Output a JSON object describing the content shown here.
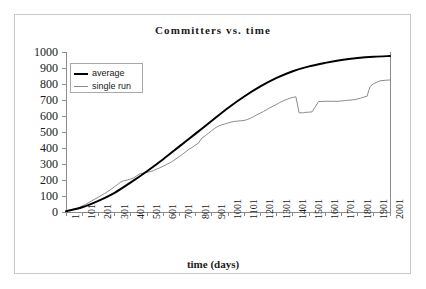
{
  "chart_data": {
    "type": "line",
    "title": "Committers vs. time",
    "xlabel": "time (days)",
    "ylabel": "",
    "xlim": [
      1,
      2001
    ],
    "ylim": [
      0,
      1000
    ],
    "grid": false,
    "legend_position": "top-left",
    "x_tick_labels": [
      "1",
      "101",
      "201",
      "301",
      "401",
      "501",
      "601",
      "701",
      "801",
      "901",
      "1001",
      "1101",
      "1201",
      "1301",
      "1401",
      "1501",
      "1601",
      "1701",
      "1801",
      "1901",
      "2001"
    ],
    "y_tick_labels": [
      "0",
      "100",
      "200",
      "300",
      "400",
      "500",
      "600",
      "700",
      "800",
      "900",
      "1000"
    ],
    "y_ticks": [
      0,
      100,
      200,
      300,
      400,
      500,
      600,
      700,
      800,
      900,
      1000
    ],
    "x": [
      1,
      101,
      201,
      301,
      401,
      501,
      601,
      701,
      801,
      901,
      1001,
      1101,
      1201,
      1301,
      1401,
      1501,
      1601,
      1701,
      1801,
      1901,
      2001
    ],
    "series": [
      {
        "name": "average",
        "color": "#000000",
        "width": 2,
        "values": [
          5,
          30,
          70,
          120,
          185,
          255,
          330,
          410,
          490,
          570,
          650,
          722,
          785,
          838,
          880,
          910,
          932,
          950,
          962,
          970,
          975
        ]
      },
      {
        "name": "single run",
        "color": "#8c8c8c",
        "width": 1,
        "values": [
          5,
          28,
          75,
          135,
          215,
          262,
          330,
          420,
          505,
          575,
          645,
          720,
          782,
          820,
          820,
          822,
          822,
          822,
          824,
          825,
          825
        ],
        "step_points_x": [
          1,
          40,
          80,
          120,
          160,
          200,
          240,
          280,
          300,
          320,
          340,
          360,
          380,
          400,
          420,
          440,
          460,
          480,
          500,
          520,
          540,
          560,
          580,
          600,
          620,
          640,
          660,
          680,
          700,
          720,
          740,
          760,
          780,
          800,
          820,
          830,
          840,
          860,
          880,
          900,
          920,
          940,
          960,
          980,
          1000,
          1020,
          1040,
          1060,
          1080,
          1100,
          1120,
          1140,
          1160,
          1180,
          1200,
          1220,
          1240,
          1260,
          1280,
          1300,
          1320,
          1340,
          1360,
          1380,
          1400,
          1420,
          1440,
          1460,
          1465,
          1470,
          1500,
          1520,
          1560,
          1600,
          1640,
          1680,
          1700,
          1720,
          1740,
          1760,
          1780,
          1800,
          1820,
          1840,
          1860,
          1870,
          1880,
          1900,
          1940,
          1980,
          2001
        ],
        "step_points_y": [
          4,
          14,
          28,
          46,
          70,
          92,
          116,
          142,
          158,
          172,
          188,
          196,
          200,
          206,
          214,
          228,
          240,
          244,
          248,
          252,
          258,
          268,
          276,
          286,
          296,
          306,
          318,
          332,
          346,
          360,
          376,
          392,
          404,
          418,
          432,
          448,
          462,
          476,
          492,
          508,
          524,
          536,
          544,
          550,
          556,
          562,
          566,
          568,
          570,
          572,
          578,
          586,
          596,
          608,
          618,
          628,
          640,
          652,
          662,
          672,
          684,
          694,
          702,
          710,
          716,
          720,
          620,
          620,
          620,
          622,
          624,
          626,
          690,
          692,
          692,
          692,
          694,
          696,
          698,
          700,
          702,
          706,
          712,
          718,
          724,
          760,
          786,
          802,
          820,
          824,
          825,
          825,
          825
        ]
      }
    ],
    "legend": [
      {
        "label": "average",
        "style": "thick-black-line"
      },
      {
        "label": "single run",
        "style": "thin-gray-line"
      }
    ]
  },
  "colors": {
    "axis": "#8c8c8c",
    "text": "#1a1a1a",
    "frame": "#c9c9c9",
    "average_line": "#000000",
    "single_run_line": "#8c8c8c",
    "background": "#ffffff"
  },
  "geometry": {
    "plot_left": 66,
    "plot_right": 390,
    "plot_top": 52,
    "plot_bottom": 212
  }
}
